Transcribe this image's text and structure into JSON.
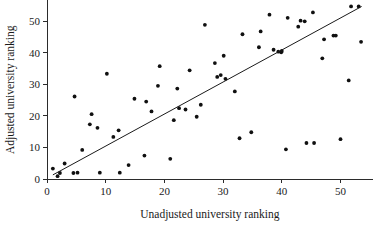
{
  "chart_data": {
    "type": "scatter",
    "title": "",
    "xlabel": "Unadjusted university ranking",
    "ylabel": "Adjusted university ranking",
    "xlim": [
      0,
      55.5
    ],
    "ylim": [
      0,
      56.5
    ],
    "xticks": [
      0,
      10,
      20,
      30,
      40,
      50
    ],
    "yticks": [
      0,
      10,
      20,
      30,
      40,
      50
    ],
    "xticklabels": [
      "0",
      "10",
      "20",
      "30",
      "40",
      "50"
    ],
    "yticklabels": [
      "0",
      "10",
      "20",
      "30",
      "40",
      "50"
    ],
    "grid": false,
    "legend": false,
    "marker": "filled-circle",
    "marker_color": "#101010",
    "line_color": "#1a1a1a",
    "background_color": "#ffffff",
    "series": [
      {
        "name": "universities",
        "x": [
          1.0,
          1.8,
          2.2,
          3.0,
          4.5,
          4.7,
          5.2,
          6.0,
          7.3,
          7.6,
          8.6,
          9.0,
          10.2,
          11.3,
          12.2,
          12.4,
          13.9,
          14.9,
          16.6,
          16.9,
          17.8,
          18.9,
          19.2,
          21.0,
          21.6,
          22.2,
          22.5,
          23.6,
          24.3,
          25.5,
          26.2,
          26.9,
          28.6,
          29.0,
          29.6,
          30.1,
          30.4,
          32.0,
          32.8,
          33.3,
          34.8,
          36.1,
          36.4,
          37.9,
          38.6,
          39.4,
          39.9,
          40.0,
          40.7,
          41.0,
          42.8,
          43.2,
          43.9,
          44.2,
          45.3,
          45.5,
          46.9,
          47.2,
          48.8,
          49.2,
          50.0,
          51.4,
          51.8,
          53.1,
          53.5
        ],
        "y": [
          3.3,
          0.9,
          1.9,
          4.9,
          1.9,
          26.1,
          2.0,
          9.2,
          17.3,
          20.5,
          16.2,
          2.0,
          33.3,
          13.3,
          15.4,
          2.0,
          4.4,
          25.4,
          7.4,
          24.5,
          21.4,
          29.5,
          35.7,
          6.4,
          18.6,
          28.6,
          22.4,
          22.0,
          34.4,
          19.7,
          23.5,
          48.8,
          36.7,
          32.3,
          32.9,
          39.0,
          31.7,
          27.7,
          12.9,
          45.8,
          14.8,
          41.7,
          46.7,
          52.0,
          40.9,
          40.3,
          40.1,
          40.5,
          9.4,
          51.0,
          48.2,
          50.1,
          49.9,
          11.4,
          52.7,
          11.4,
          38.2,
          44.2,
          45.4,
          45.4,
          12.6,
          31.2,
          54.6,
          54.6,
          43.4
        ]
      }
    ],
    "fit_line": {
      "name": "reference line",
      "x0": 1.0,
      "y0": 1.3,
      "x1": 53.6,
      "y1": 54.6
    }
  }
}
